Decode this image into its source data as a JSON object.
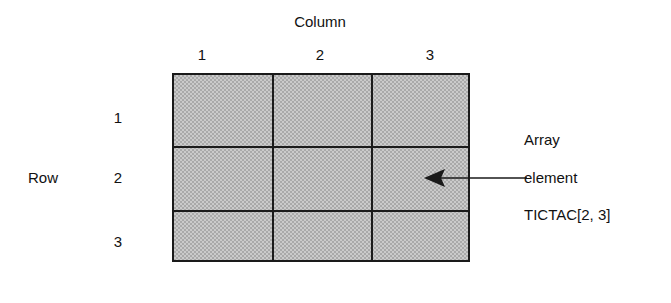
{
  "diagram": {
    "column_axis_title": "Column",
    "row_axis_title": "Row",
    "column_headers": [
      "1",
      "2",
      "3"
    ],
    "row_headers": [
      "1",
      "2",
      "3"
    ],
    "annotation": {
      "line1": "Array",
      "line2": "element",
      "line3": "TICTAC[2, 3]"
    },
    "pointer": {
      "target_row": "2",
      "target_column": "3",
      "direction": "left"
    },
    "colors": {
      "cell_fill": "#a9a9a9",
      "grid_line": "#1a1a1a",
      "text": "#111111",
      "background": "#ffffff"
    },
    "grid": {
      "rows": 3,
      "columns": 3
    }
  }
}
